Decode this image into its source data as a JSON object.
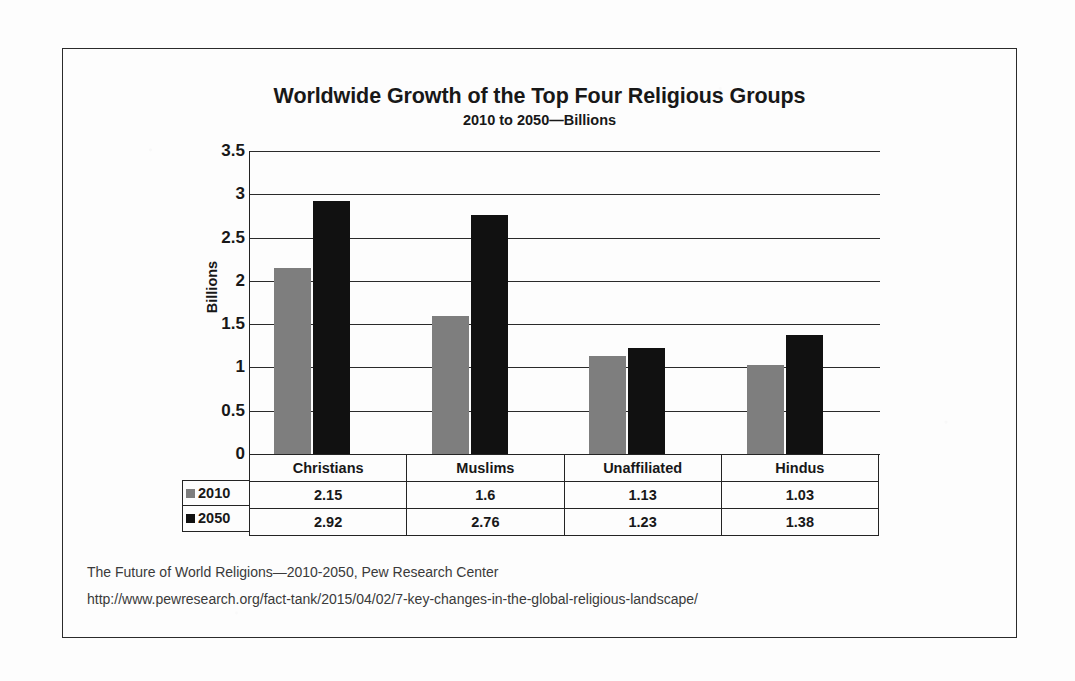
{
  "chart_data": {
    "type": "bar",
    "title": "Worldwide Growth of the Top Four Religious Groups",
    "subtitle": "2010 to 2050—Billions",
    "xlabel": "",
    "ylabel": "Billions",
    "ylim": [
      0,
      3.5
    ],
    "ytick_values": [
      3.5,
      3,
      2.5,
      2,
      1.5,
      1,
      0.5,
      0
    ],
    "ytick_labels": [
      "3.5",
      "3",
      "2.5",
      "2",
      "1.5",
      "1",
      "0.5",
      "0"
    ],
    "grid": true,
    "legend_position": "data-table-left",
    "categories": [
      "Christians",
      "Muslims",
      "Unaffiliated",
      "Hindus"
    ],
    "series": [
      {
        "name": "2010",
        "color": "#7e7e7e",
        "values": [
          2.15,
          1.6,
          1.13,
          1.03
        ],
        "labels": [
          "2.15",
          "1.6",
          "1.13",
          "1.03"
        ]
      },
      {
        "name": "2050",
        "color": "#111111",
        "values": [
          2.92,
          2.76,
          1.23,
          1.38
        ],
        "labels": [
          "2.92",
          "2.76",
          "1.23",
          "1.38"
        ]
      }
    ]
  },
  "footer": {
    "line1": "The Future of World Religions—2010-2050, Pew Research Center",
    "line2": "http://www.pewresearch.org/fact-tank/2015/04/02/7-key-changes-in-the-global-religious-landscape/"
  }
}
